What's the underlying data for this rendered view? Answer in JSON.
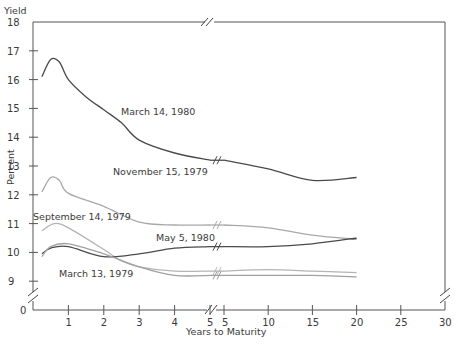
{
  "chart_data": {
    "type": "line",
    "title": "",
    "xlabel": "Years to Maturity",
    "ylabel": "Percent",
    "y_axis_heading": "Yield",
    "ylim": [
      9,
      18
    ],
    "y_ticks": [
      18,
      17,
      16,
      15,
      14,
      13,
      12,
      11,
      10,
      9,
      0
    ],
    "x_ticks_left": [
      1,
      2,
      3,
      4,
      5
    ],
    "x_ticks_right": [
      5,
      10,
      15,
      20,
      25,
      30
    ],
    "x_axis_break_between": [
      5,
      5
    ],
    "grid": false,
    "legend": "inline labels",
    "series": [
      {
        "name": "March 14, 1980",
        "color": "#4a4a4a",
        "x": [
          0.25,
          0.5,
          0.75,
          1,
          1.5,
          2,
          2.5,
          3,
          4,
          5,
          10,
          15,
          20
        ],
        "values": [
          16.1,
          16.7,
          16.6,
          16.0,
          15.4,
          14.95,
          14.5,
          13.9,
          13.45,
          13.2,
          12.9,
          12.5,
          12.6
        ]
      },
      {
        "name": "November 15, 1979",
        "color": "#a8a8a8",
        "x": [
          0.25,
          0.5,
          0.75,
          1,
          2,
          3,
          4,
          5,
          10,
          15,
          20
        ],
        "values": [
          12.1,
          12.6,
          12.5,
          12.05,
          11.6,
          11.05,
          10.95,
          10.95,
          10.85,
          10.6,
          10.45
        ]
      },
      {
        "name": "September 14, 1979",
        "color": "#b4b4b4",
        "x": [
          0.25,
          0.6,
          1,
          2,
          2.5,
          3,
          4,
          5,
          10,
          15,
          20
        ],
        "values": [
          10.75,
          11.0,
          10.85,
          10.1,
          9.7,
          9.5,
          9.35,
          9.35,
          9.4,
          9.35,
          9.3
        ]
      },
      {
        "name": "May 5, 1980",
        "color": "#4a4a4a",
        "x": [
          0.25,
          0.5,
          1,
          2,
          3,
          4,
          5,
          10,
          15,
          20
        ],
        "values": [
          9.95,
          10.15,
          10.2,
          9.85,
          9.95,
          10.15,
          10.2,
          10.2,
          10.3,
          10.5
        ]
      },
      {
        "name": "March 13, 1979",
        "color": "#a0a0a0",
        "x": [
          0.25,
          0.5,
          1,
          2,
          3,
          4,
          5,
          10,
          15,
          20
        ],
        "values": [
          9.85,
          10.2,
          10.3,
          9.95,
          9.5,
          9.2,
          9.2,
          9.2,
          9.2,
          9.15
        ]
      }
    ],
    "annotations": [
      {
        "text": "March 14, 1980",
        "x": 121,
        "y": 115
      },
      {
        "text": "November 15, 1979",
        "x": 113,
        "y": 175
      },
      {
        "text": "September 14, 1979",
        "x": 33,
        "y": 220
      },
      {
        "text": "May 5, 1980",
        "x": 156,
        "y": 241
      },
      {
        "text": "March 13, 1979",
        "x": 59,
        "y": 277
      }
    ]
  }
}
